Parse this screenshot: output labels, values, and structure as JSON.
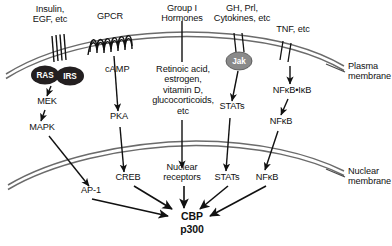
{
  "figure": {
    "type": "diagram",
    "background_color": "#ffffff",
    "membrane_color": "#6b6b6b",
    "arrow_color": "#111111",
    "node_fill_dark": "#231f20",
    "node_fill_gray": "#8a8a8a"
  },
  "membranes": [
    {
      "name": "plasma-membrane",
      "label": "Plasma\nmembrane"
    },
    {
      "name": "nuclear-membrane",
      "label": "Nuclear\nmembrane"
    }
  ],
  "ligands": [
    {
      "name": "insulin-egf",
      "label": "Insulin,\nEGF, etc"
    },
    {
      "name": "gpcr",
      "label": "GPCR"
    },
    {
      "name": "group-i-hormones",
      "label": "Group I\nHormones"
    },
    {
      "name": "gh-prl-cytokines",
      "label": "GH, Prl,\nCytokines, etc"
    },
    {
      "name": "tnf",
      "label": "TNF, etc"
    }
  ],
  "receptor_nodes": [
    {
      "name": "ras",
      "label": "RAS",
      "style": "dark-oval"
    },
    {
      "name": "irs",
      "label": "IRS",
      "style": "dark-oval"
    },
    {
      "name": "jak",
      "label": "Jak",
      "style": "gray-oval"
    }
  ],
  "cytoplasm_labels": [
    {
      "name": "mek",
      "label": "MEK"
    },
    {
      "name": "mapk",
      "label": "MAPK"
    },
    {
      "name": "camp",
      "label": "cAMP"
    },
    {
      "name": "pka",
      "label": "PKA"
    },
    {
      "name": "group-i-ligand-list",
      "label": "Retinoic acid,\nestrogen,\nvitamin D,\nglucocorticoids,\netc"
    },
    {
      "name": "stats-cytoplasm",
      "label": "STATs"
    },
    {
      "name": "nfkb-ikb-complex",
      "label": "NFκB•IκB"
    },
    {
      "name": "nfkb-cytoplasm",
      "label": "NFκB"
    }
  ],
  "nucleus_labels": [
    {
      "name": "ap-1",
      "label": "AP-1"
    },
    {
      "name": "creb",
      "label": "CREB"
    },
    {
      "name": "nuclear-receptors",
      "label": "Nuclear\nreceptors"
    },
    {
      "name": "stats-nucleus",
      "label": "STATs"
    },
    {
      "name": "nfkb-nucleus",
      "label": "NFκB"
    }
  ],
  "target": {
    "name": "cbp-p300",
    "line1": "CBP",
    "line2": "p300"
  }
}
